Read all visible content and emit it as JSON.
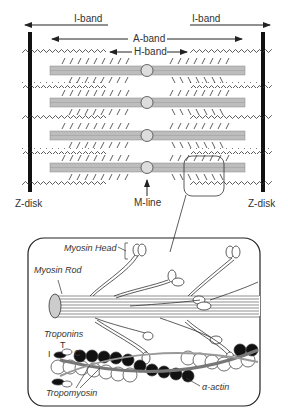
{
  "sarcomere": {
    "labels": {
      "i_band_left": "I-band",
      "i_band_right": "I-band",
      "a_band": "A-band",
      "h_band": "H-band",
      "m_line": "M-line",
      "z_disk_left": "Z-disk",
      "z_disk_right": "Z-disk"
    },
    "thick_filament_count": 4
  },
  "inset": {
    "labels": {
      "myosin_head": "Myosin Head",
      "myosin_rod": "Myosin Rod",
      "troponins": "Troponins",
      "troponin_t": "T",
      "troponin_i": "I",
      "troponin_c": "C",
      "tropomyosin": "Tropomyosin",
      "alpha_actin": "α-actin"
    }
  },
  "colors": {
    "line": "#222222",
    "filament_fill": "#bdbdbd",
    "dark_actin": "#111111"
  }
}
